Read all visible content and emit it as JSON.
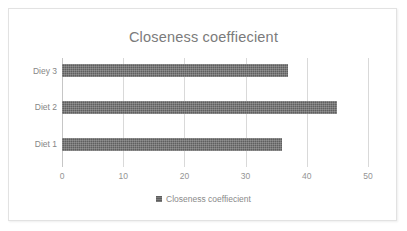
{
  "chart_data": {
    "type": "bar",
    "orientation": "horizontal",
    "title": "Closeness coeffiecient",
    "xlabel": "",
    "ylabel": "",
    "categories": [
      "Diet 1",
      "Diet 2",
      "Diey 3"
    ],
    "values": [
      36,
      45,
      37
    ],
    "series": [
      {
        "name": "Closeness coeffiecient",
        "values": [
          36,
          45,
          37
        ],
        "color": "#5f5f5f"
      }
    ],
    "xlim": [
      0,
      50
    ],
    "xticks": [
      0,
      10,
      20,
      30,
      40,
      50
    ],
    "xtick_labels": [
      "0",
      "10",
      "20",
      "30",
      "40",
      "50"
    ],
    "grid": true,
    "grid_axis": "x",
    "legend": {
      "position": "bottom",
      "entries": [
        "Closeness coeffiecient"
      ]
    }
  },
  "colors": {
    "bar": "#5f5f5f",
    "gridline": "#d9d9d9",
    "title_text": "#7b7b7b",
    "axis_text": "#8f8f8f",
    "frame_border": "#e2e2e2",
    "background": "#ffffff"
  }
}
